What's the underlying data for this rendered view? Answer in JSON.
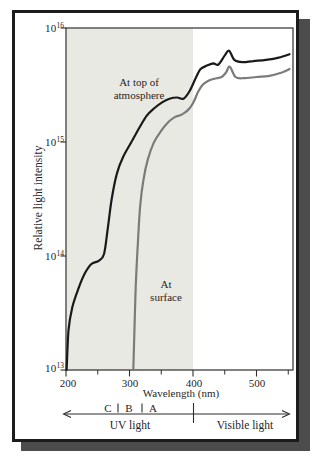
{
  "figure": {
    "ylabel": "Relative light intensity",
    "xlabel": "Wavelength (nm)",
    "yticks": [
      {
        "base": "10",
        "exp": "16"
      },
      {
        "base": "10",
        "exp": "15"
      },
      {
        "base": "10",
        "exp": "14"
      },
      {
        "base": "10",
        "exp": "13"
      }
    ],
    "xticks": [
      "200",
      "300",
      "400",
      "500"
    ],
    "curve_labels": {
      "top_line1": "At top of",
      "top_line2": "atmosphere",
      "surface_line1": "At",
      "surface_line2": "surface"
    },
    "uv_bands": {
      "c": "C",
      "b": "B",
      "a": "A"
    },
    "regions": {
      "uv": "UV light",
      "visible": "Visible light"
    },
    "colors": {
      "curve_top": "#1a1a1a",
      "curve_surface": "#7b7b7b",
      "uv_shading": "#e9e9e4",
      "axis": "#2d2d2d",
      "frame": "#1c1c1c",
      "frame_shadow": "#4c4c4c"
    }
  },
  "chart_data": {
    "type": "line",
    "title": "",
    "xlabel": "Wavelength (nm)",
    "ylabel": "Relative light intensity",
    "x_unit": "nm",
    "xlim": [
      200,
      560
    ],
    "yscale": "log",
    "ylim": [
      10000000000000.0,
      1e+16
    ],
    "ytick_values": [
      10000000000000.0,
      100000000000000.0,
      1000000000000000.0,
      1e+16
    ],
    "x_major_ticks": [
      200,
      300,
      400,
      500
    ],
    "x_minor_ticks": [
      250,
      350,
      450,
      550
    ],
    "grid": false,
    "legend_position": "inline-annotations",
    "shaded_region": {
      "label": "UV light",
      "x_range_nm": [
        200,
        400
      ]
    },
    "uv_band_boundaries_nm": [
      280,
      315,
      400
    ],
    "series": [
      {
        "name": "At top of atmosphere",
        "color": "#1a1a1a",
        "width": 2.2,
        "points_log10": [
          [
            201,
            13.0
          ],
          [
            204,
            13.35
          ],
          [
            210,
            13.55
          ],
          [
            220,
            13.72
          ],
          [
            230,
            13.85
          ],
          [
            240,
            13.93
          ],
          [
            252,
            13.96
          ],
          [
            260,
            14.02
          ],
          [
            266,
            14.25
          ],
          [
            272,
            14.5
          ],
          [
            280,
            14.72
          ],
          [
            290,
            14.87
          ],
          [
            303,
            15.0
          ],
          [
            315,
            15.12
          ],
          [
            327,
            15.23
          ],
          [
            340,
            15.3
          ],
          [
            352,
            15.35
          ],
          [
            363,
            15.38
          ],
          [
            375,
            15.39
          ],
          [
            385,
            15.38
          ],
          [
            395,
            15.45
          ],
          [
            405,
            15.57
          ],
          [
            412,
            15.64
          ],
          [
            422,
            15.67
          ],
          [
            432,
            15.69
          ],
          [
            440,
            15.68
          ],
          [
            450,
            15.76
          ],
          [
            457,
            15.8
          ],
          [
            465,
            15.72
          ],
          [
            478,
            15.7
          ],
          [
            495,
            15.71
          ],
          [
            515,
            15.72
          ],
          [
            535,
            15.74
          ],
          [
            552,
            15.77
          ]
        ]
      },
      {
        "name": "At surface",
        "color": "#7b7b7b",
        "width": 2.2,
        "points_log10": [
          [
            306,
            13.0
          ],
          [
            308,
            13.4
          ],
          [
            310,
            13.75
          ],
          [
            313,
            14.1
          ],
          [
            317,
            14.45
          ],
          [
            322,
            14.67
          ],
          [
            329,
            14.85
          ],
          [
            338,
            14.99
          ],
          [
            350,
            15.1
          ],
          [
            362,
            15.18
          ],
          [
            372,
            15.22
          ],
          [
            382,
            15.24
          ],
          [
            392,
            15.28
          ],
          [
            400,
            15.34
          ],
          [
            408,
            15.44
          ],
          [
            415,
            15.5
          ],
          [
            425,
            15.54
          ],
          [
            437,
            15.56
          ],
          [
            445,
            15.57
          ],
          [
            452,
            15.61
          ],
          [
            458,
            15.66
          ],
          [
            467,
            15.57
          ],
          [
            480,
            15.56
          ],
          [
            500,
            15.57
          ],
          [
            520,
            15.58
          ],
          [
            540,
            15.61
          ],
          [
            552,
            15.64
          ]
        ]
      }
    ]
  }
}
